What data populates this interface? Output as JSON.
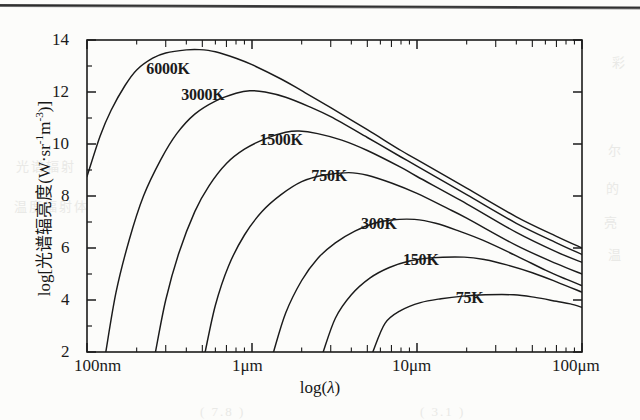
{
  "figure": {
    "background_color": "#fcfcfa",
    "ink_color": "#1b1b1b"
  },
  "axis_labels": {
    "y_prefix": "log[",
    "y_chinese": "光谱辐亮度",
    "y_units_open": "(W·sr",
    "y_sup1": "-1",
    "y_unit_m": "m",
    "y_sup2": "-3",
    "y_units_close": ")]",
    "x_label_prefix": "log(",
    "x_label_symbol": "λ",
    "x_label_suffix": ")"
  },
  "chart_data": {
    "type": "line",
    "title": "",
    "xlabel": "log(λ)",
    "ylabel": "log[光谱辐亮度(W·sr-1m-3)]",
    "grid": false,
    "legend": "inline-curve-labels",
    "x_axis": {
      "scale": "log10",
      "unit": "wavelength",
      "ticks": [
        "100nm",
        "1μm",
        "10μm",
        "100μm"
      ],
      "tick_values_um": [
        0.1,
        1,
        10,
        100
      ],
      "xlim_um": [
        0.1,
        100
      ],
      "minor_ticks": "decade-subdivisions"
    },
    "y_axis": {
      "ticks": [
        "14",
        "12",
        "10",
        "8",
        "6",
        "4",
        "2"
      ],
      "tick_values": [
        14,
        12,
        10,
        8,
        6,
        4,
        2
      ],
      "ylim": [
        2,
        14
      ],
      "minor_tick_step": 1
    },
    "series": [
      {
        "name": "6000K",
        "temperature_k": 6000,
        "label_pos_um": 0.32,
        "label_pos_y": 12.85,
        "peak_um": 0.483,
        "peak_y": 13.6,
        "points": [
          [
            0.1,
            8.75
          ],
          [
            0.12,
            10.3
          ],
          [
            0.14,
            11.3
          ],
          [
            0.17,
            12.25
          ],
          [
            0.2,
            12.85
          ],
          [
            0.25,
            13.3
          ],
          [
            0.3,
            13.5
          ],
          [
            0.4,
            13.62
          ],
          [
            0.48,
            13.63
          ],
          [
            0.6,
            13.55
          ],
          [
            0.8,
            13.3
          ],
          [
            1.0,
            13.05
          ],
          [
            1.5,
            12.5
          ],
          [
            2.0,
            12.05
          ],
          [
            3.0,
            11.4
          ],
          [
            5.0,
            10.55
          ],
          [
            8.0,
            9.75
          ],
          [
            10.0,
            9.4
          ],
          [
            20.0,
            8.3
          ],
          [
            40.0,
            7.2
          ],
          [
            70.0,
            6.45
          ],
          [
            100.0,
            6.0
          ]
        ]
      },
      {
        "name": "3000K",
        "temperature_k": 3000,
        "label_pos_um": 0.52,
        "label_pos_y": 11.85,
        "peak_um": 0.966,
        "peak_y": 12.05,
        "points": [
          [
            0.13,
            2.0
          ],
          [
            0.15,
            4.3
          ],
          [
            0.18,
            6.3
          ],
          [
            0.22,
            8.0
          ],
          [
            0.28,
            9.4
          ],
          [
            0.35,
            10.4
          ],
          [
            0.45,
            11.15
          ],
          [
            0.6,
            11.65
          ],
          [
            0.8,
            11.95
          ],
          [
            0.97,
            12.05
          ],
          [
            1.2,
            12.0
          ],
          [
            1.6,
            11.8
          ],
          [
            2.2,
            11.45
          ],
          [
            3.0,
            11.05
          ],
          [
            5.0,
            10.25
          ],
          [
            8.0,
            9.5
          ],
          [
            10.0,
            9.15
          ],
          [
            20.0,
            8.05
          ],
          [
            40.0,
            6.95
          ],
          [
            70.0,
            6.2
          ],
          [
            100.0,
            5.75
          ]
        ]
      },
      {
        "name": "1500K",
        "temperature_k": 1500,
        "label_pos_um": 1.55,
        "label_pos_y": 10.1,
        "peak_um": 1.93,
        "peak_y": 10.5,
        "points": [
          [
            0.26,
            2.0
          ],
          [
            0.3,
            4.0
          ],
          [
            0.36,
            5.8
          ],
          [
            0.45,
            7.4
          ],
          [
            0.55,
            8.4
          ],
          [
            0.7,
            9.25
          ],
          [
            0.9,
            9.8
          ],
          [
            1.2,
            10.2
          ],
          [
            1.6,
            10.45
          ],
          [
            1.93,
            10.5
          ],
          [
            2.5,
            10.4
          ],
          [
            3.5,
            10.15
          ],
          [
            5.0,
            9.75
          ],
          [
            8.0,
            9.1
          ],
          [
            10.0,
            8.75
          ],
          [
            20.0,
            7.7
          ],
          [
            40.0,
            6.6
          ],
          [
            70.0,
            5.85
          ],
          [
            100.0,
            5.45
          ]
        ]
      },
      {
        "name": "750K",
        "temperature_k": 750,
        "label_pos_um": 3.2,
        "label_pos_y": 8.75,
        "peak_um": 3.86,
        "peak_y": 8.9,
        "points": [
          [
            0.52,
            2.0
          ],
          [
            0.6,
            3.8
          ],
          [
            0.72,
            5.3
          ],
          [
            0.9,
            6.5
          ],
          [
            1.15,
            7.4
          ],
          [
            1.5,
            8.05
          ],
          [
            2.0,
            8.55
          ],
          [
            2.7,
            8.8
          ],
          [
            3.86,
            8.9
          ],
          [
            5.0,
            8.8
          ],
          [
            7.0,
            8.5
          ],
          [
            10.0,
            8.1
          ],
          [
            15.0,
            7.55
          ],
          [
            20.0,
            7.15
          ],
          [
            40.0,
            6.1
          ],
          [
            70.0,
            5.4
          ],
          [
            100.0,
            5.0
          ]
        ]
      },
      {
        "name": "300K",
        "temperature_k": 300,
        "label_pos_um": 6.4,
        "label_pos_y": 6.9,
        "peak_um": 9.66,
        "peak_y": 7.1,
        "points": [
          [
            1.35,
            2.0
          ],
          [
            1.6,
            3.5
          ],
          [
            2.0,
            4.75
          ],
          [
            2.5,
            5.6
          ],
          [
            3.2,
            6.2
          ],
          [
            4.2,
            6.65
          ],
          [
            5.5,
            6.95
          ],
          [
            7.0,
            7.08
          ],
          [
            9.66,
            7.1
          ],
          [
            13.0,
            6.95
          ],
          [
            18.0,
            6.65
          ],
          [
            25.0,
            6.3
          ],
          [
            40.0,
            5.7
          ],
          [
            60.0,
            5.15
          ],
          [
            80.0,
            4.8
          ],
          [
            100.0,
            4.55
          ]
        ]
      },
      {
        "name": "150K",
        "temperature_k": 150,
        "label_pos_um": 11.5,
        "label_pos_y": 5.5,
        "peak_um": 19.3,
        "peak_y": 5.65,
        "points": [
          [
            2.7,
            2.0
          ],
          [
            3.2,
            3.3
          ],
          [
            4.0,
            4.2
          ],
          [
            5.2,
            4.85
          ],
          [
            6.8,
            5.25
          ],
          [
            9.0,
            5.5
          ],
          [
            12.0,
            5.62
          ],
          [
            19.3,
            5.65
          ],
          [
            26.0,
            5.55
          ],
          [
            35.0,
            5.35
          ],
          [
            50.0,
            5.05
          ],
          [
            70.0,
            4.7
          ],
          [
            100.0,
            4.3
          ]
        ]
      },
      {
        "name": "75K",
        "temperature_k": 75,
        "label_pos_um": 24.0,
        "label_pos_y": 4.05,
        "peak_um": 38.6,
        "peak_y": 4.2,
        "points": [
          [
            5.4,
            2.0
          ],
          [
            6.4,
            3.1
          ],
          [
            8.0,
            3.6
          ],
          [
            10.5,
            3.9
          ],
          [
            14.0,
            4.05
          ],
          [
            19.0,
            4.15
          ],
          [
            26.0,
            4.2
          ],
          [
            38.6,
            4.2
          ],
          [
            52.0,
            4.1
          ],
          [
            70.0,
            3.95
          ],
          [
            85.0,
            3.85
          ],
          [
            100.0,
            3.72
          ]
        ]
      }
    ]
  },
  "bleed_marks": [
    {
      "text": "彩",
      "x": 612,
      "y": 52
    },
    {
      "text": "尔",
      "x": 608,
      "y": 140
    },
    {
      "text": "的",
      "x": 606,
      "y": 178
    },
    {
      "text": "亮",
      "x": 604,
      "y": 212
    },
    {
      "text": "温",
      "x": 608,
      "y": 244
    },
    {
      "text": "光谱辐射",
      "x": 16,
      "y": 156
    },
    {
      "text": "温度辐射体",
      "x": 14,
      "y": 196
    },
    {
      "text": "( 7.8 )",
      "x": 200,
      "y": 404
    },
    {
      "text": "( 3.1 )",
      "x": 420,
      "y": 404
    }
  ]
}
